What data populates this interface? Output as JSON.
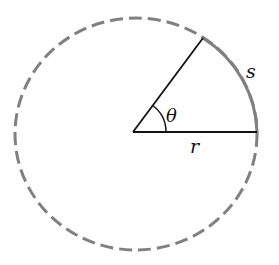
{
  "diagram": {
    "labels": {
      "theta": "θ",
      "radius": "r",
      "arc": "s"
    },
    "colors": {
      "circle_dashed": "#808080",
      "arc_solid": "#808080",
      "lines": "#111111",
      "background": "#ffffff"
    },
    "geometry": {
      "center": [
        133,
        132
      ],
      "radius_x": 123,
      "radius_y": 116,
      "radius_end": [
        257,
        132
      ],
      "angle_ray_end": [
        203,
        38
      ],
      "angle_arc_radius": 33
    }
  }
}
